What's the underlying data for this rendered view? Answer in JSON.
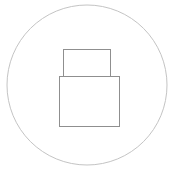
{
  "icon": {
    "name": "sketched-device-icon",
    "stroke_color": "#9a9a9a",
    "circle_stroke_color": "#bdbdbd",
    "background": "#ffffff"
  }
}
